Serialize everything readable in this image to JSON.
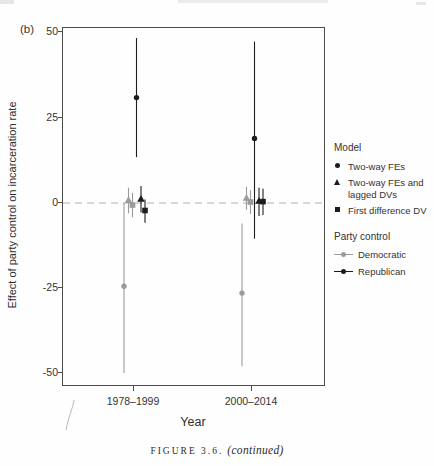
{
  "page": {
    "panel_label": "(b)",
    "caption_figure": "FIGURE 3.6.",
    "caption_continued": "(continued)"
  },
  "axes": {
    "y_title": "Effect of party control on incarceration rate",
    "x_title": "Year",
    "y_ticks": [
      "50",
      "25",
      "0",
      "-25",
      "-50"
    ],
    "x_ticks": [
      "1978–1999",
      "2000–2014"
    ]
  },
  "legend": {
    "model_title": "Model",
    "model_items": [
      {
        "marker": "circle",
        "label": "Two-way FEs"
      },
      {
        "marker": "triangle",
        "label": "Two-way FEs and lagged DVs"
      },
      {
        "marker": "square",
        "label": "First difference DV"
      }
    ],
    "party_title": "Party control",
    "party_items": [
      {
        "label": "Democratic",
        "color": "#9b9b9b"
      },
      {
        "label": "Republican",
        "color": "#1c1c1c"
      }
    ]
  },
  "colors": {
    "democratic": "#9b9b9b",
    "republican": "#1c1c1c",
    "zero_line": "#b0b0b0",
    "panel_border": "#4d4d4d",
    "text": "#2e2e2e"
  },
  "chart_data": {
    "type": "scatter",
    "subtype": "coefficient point-range plot with 95% CIs",
    "title": "",
    "xlabel": "Year",
    "ylabel": "Effect of party control on incarceration rate",
    "ylim": [
      -54,
      51
    ],
    "yticks": [
      50,
      25,
      0,
      -25,
      -50
    ],
    "categories": [
      "1978–1999",
      "2000–2014"
    ],
    "zero_reference_line": 0,
    "grid": false,
    "legend_position": "right",
    "series": [
      {
        "party": "Democratic",
        "model": "Two-way FEs",
        "marker": "circle",
        "color": "#9b9b9b",
        "points": [
          {
            "category": "1978–1999",
            "estimate": -24.5,
            "ci_low": -50,
            "ci_high": 0
          },
          {
            "category": "2000–2014",
            "estimate": -26.5,
            "ci_low": -48,
            "ci_high": -6
          }
        ]
      },
      {
        "party": "Democratic",
        "model": "Two-way FEs and lagged DVs",
        "marker": "triangle",
        "color": "#9b9b9b",
        "points": [
          {
            "category": "1978–1999",
            "estimate": 0.8,
            "ci_low": -3,
            "ci_high": 4.5
          },
          {
            "category": "2000–2014",
            "estimate": 1.5,
            "ci_low": -2,
            "ci_high": 4.8
          }
        ]
      },
      {
        "party": "Democratic",
        "model": "First difference DV",
        "marker": "square",
        "color": "#9b9b9b",
        "points": [
          {
            "category": "1978–1999",
            "estimate": -0.6,
            "ci_low": -4.2,
            "ci_high": 3
          },
          {
            "category": "2000–2014",
            "estimate": 0.3,
            "ci_low": -3.2,
            "ci_high": 3.8
          }
        ]
      },
      {
        "party": "Republican",
        "model": "Two-way FEs",
        "marker": "circle",
        "color": "#1c1c1c",
        "points": [
          {
            "category": "1978–1999",
            "estimate": 31,
            "ci_low": 13.5,
            "ci_high": 48.5
          },
          {
            "category": "2000–2014",
            "estimate": 19,
            "ci_low": -10.5,
            "ci_high": 47.5
          }
        ]
      },
      {
        "party": "Republican",
        "model": "Two-way FEs and lagged DVs",
        "marker": "triangle",
        "color": "#1c1c1c",
        "points": [
          {
            "category": "1978–1999",
            "estimate": 1.2,
            "ci_low": -2.8,
            "ci_high": 5
          },
          {
            "category": "2000–2014",
            "estimate": 0.6,
            "ci_low": -3.8,
            "ci_high": 4.5
          }
        ]
      },
      {
        "party": "Republican",
        "model": "First difference DV",
        "marker": "square",
        "color": "#1c1c1c",
        "points": [
          {
            "category": "1978–1999",
            "estimate": -2.2,
            "ci_low": -5.8,
            "ci_high": 1
          },
          {
            "category": "2000–2014",
            "estimate": 0.4,
            "ci_low": -3.5,
            "ci_high": 4.2
          }
        ]
      }
    ]
  }
}
